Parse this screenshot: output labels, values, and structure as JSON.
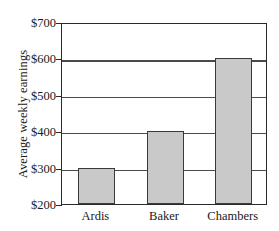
{
  "chart_data": {
    "type": "bar",
    "title": "",
    "subtitle": "",
    "xlabel": "",
    "ylabel": "Average weekly earnings",
    "categories": [
      "Ardis",
      "Baker",
      "Chambers"
    ],
    "values": [
      300,
      400,
      600
    ],
    "value_prefix": "$",
    "ylim": [
      200,
      700
    ],
    "ytick_step": 100,
    "ytick_labels": [
      "$700",
      "$600",
      "$500",
      "$400",
      "$300",
      "$200"
    ],
    "ytick_values": [
      700,
      600,
      500,
      400,
      300,
      200
    ],
    "grid": "horizontal",
    "legend": "none",
    "series": [
      {
        "name": "Average weekly earnings",
        "values": [
          300,
          400,
          600
        ]
      }
    ],
    "colors": {
      "bar_fill": "#c9c9c9",
      "bar_border": "#3a3a3a",
      "axis": "#2b2b2b",
      "gridline": "#4a4a4a",
      "text": "#1a1a1a",
      "background": "#ffffff"
    }
  }
}
